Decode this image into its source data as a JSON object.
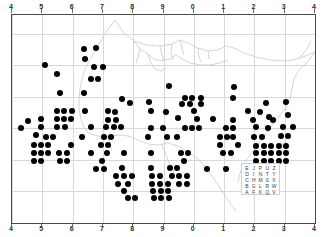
{
  "figure": {
    "kind": "distribution-dot-map",
    "background_color": "#ffffff",
    "frame_color": "#4a4a4a",
    "grid_color": "#d8d8d8",
    "dot_color": "#000000",
    "coastline_color": "#c8c8c8"
  },
  "axes": {
    "top_labels": [
      "4",
      "5",
      "6",
      "7",
      "8",
      "9",
      "0",
      "1",
      "2",
      "3",
      "4"
    ],
    "bottom_labels": [
      "4",
      "5",
      "6",
      "7",
      "8",
      "9",
      "0",
      "1",
      "2",
      "3",
      "4"
    ],
    "left_labels": [
      "8",
      "7",
      "6",
      "5",
      "4",
      "3",
      "2"
    ],
    "right_labels": [
      "8",
      "7",
      "6",
      "5",
      "4",
      "3",
      "2"
    ]
  },
  "legend": {
    "name": "utm-letter-square",
    "rows": [
      [
        "E",
        "J",
        "P",
        "U",
        "Z"
      ],
      [
        "D",
        "I",
        "N",
        "T",
        "Y"
      ],
      [
        "C",
        "H",
        "M",
        "S",
        "X"
      ],
      [
        "B",
        "G",
        "L",
        "R",
        "W"
      ],
      [
        "A",
        "F",
        "K",
        "Q",
        "V"
      ]
    ]
  },
  "chart_data": {
    "type": "scatter",
    "title": "",
    "xlabel": "",
    "ylabel": "",
    "xlim": [
      4,
      14
    ],
    "ylim": [
      2,
      8.6
    ],
    "grid": true,
    "legend_position": "bottom-right",
    "points": [
      {
        "x": 6.38,
        "y": 7.52
      },
      {
        "x": 6.78,
        "y": 7.55
      },
      {
        "x": 6.4,
        "y": 7.22
      },
      {
        "x": 5.1,
        "y": 7.02
      },
      {
        "x": 6.72,
        "y": 6.95
      },
      {
        "x": 7.0,
        "y": 6.95
      },
      {
        "x": 5.5,
        "y": 6.72
      },
      {
        "x": 6.62,
        "y": 6.58
      },
      {
        "x": 6.85,
        "y": 6.58
      },
      {
        "x": 5.58,
        "y": 6.12
      },
      {
        "x": 6.38,
        "y": 6.12
      },
      {
        "x": 9.18,
        "y": 6.35
      },
      {
        "x": 11.32,
        "y": 6.32
      },
      {
        "x": 7.62,
        "y": 5.95
      },
      {
        "x": 9.72,
        "y": 5.98
      },
      {
        "x": 9.95,
        "y": 5.98
      },
      {
        "x": 11.3,
        "y": 5.98
      },
      {
        "x": 10.22,
        "y": 5.98
      },
      {
        "x": 7.88,
        "y": 5.82
      },
      {
        "x": 8.52,
        "y": 5.85
      },
      {
        "x": 9.62,
        "y": 5.78
      },
      {
        "x": 9.88,
        "y": 5.78
      },
      {
        "x": 10.22,
        "y": 5.78
      },
      {
        "x": 13.05,
        "y": 5.85
      },
      {
        "x": 12.38,
        "y": 5.8
      },
      {
        "x": 5.48,
        "y": 5.55
      },
      {
        "x": 5.72,
        "y": 5.55
      },
      {
        "x": 5.98,
        "y": 5.55
      },
      {
        "x": 6.42,
        "y": 5.55
      },
      {
        "x": 7.18,
        "y": 5.55
      },
      {
        "x": 7.4,
        "y": 5.52
      },
      {
        "x": 8.6,
        "y": 5.55
      },
      {
        "x": 9.08,
        "y": 5.52
      },
      {
        "x": 9.48,
        "y": 5.32
      },
      {
        "x": 10.02,
        "y": 5.55
      },
      {
        "x": 11.78,
        "y": 5.55
      },
      {
        "x": 12.18,
        "y": 5.52
      },
      {
        "x": 12.48,
        "y": 5.35
      },
      {
        "x": 13.12,
        "y": 5.42
      },
      {
        "x": 4.52,
        "y": 5.25
      },
      {
        "x": 4.95,
        "y": 5.3
      },
      {
        "x": 5.48,
        "y": 5.3
      },
      {
        "x": 5.72,
        "y": 5.3
      },
      {
        "x": 5.95,
        "y": 5.3
      },
      {
        "x": 7.18,
        "y": 5.28
      },
      {
        "x": 7.42,
        "y": 5.28
      },
      {
        "x": 10.12,
        "y": 5.3
      },
      {
        "x": 10.62,
        "y": 5.3
      },
      {
        "x": 11.3,
        "y": 5.28
      },
      {
        "x": 11.95,
        "y": 5.28
      },
      {
        "x": 12.62,
        "y": 5.28
      },
      {
        "x": 4.28,
        "y": 5.02
      },
      {
        "x": 4.95,
        "y": 5.05
      },
      {
        "x": 5.5,
        "y": 5.05
      },
      {
        "x": 5.75,
        "y": 5.05
      },
      {
        "x": 6.62,
        "y": 5.05
      },
      {
        "x": 7.1,
        "y": 5.05
      },
      {
        "x": 7.35,
        "y": 5.05
      },
      {
        "x": 7.6,
        "y": 5.05
      },
      {
        "x": 8.6,
        "y": 5.02
      },
      {
        "x": 8.98,
        "y": 5.02
      },
      {
        "x": 9.72,
        "y": 5.02
      },
      {
        "x": 9.95,
        "y": 5.02
      },
      {
        "x": 10.18,
        "y": 5.02
      },
      {
        "x": 11.05,
        "y": 5.02
      },
      {
        "x": 11.3,
        "y": 5.02
      },
      {
        "x": 12.05,
        "y": 5.05
      },
      {
        "x": 12.45,
        "y": 5.02
      },
      {
        "x": 12.95,
        "y": 5.05
      },
      {
        "x": 13.28,
        "y": 5.05
      },
      {
        "x": 4.8,
        "y": 4.78
      },
      {
        "x": 5.12,
        "y": 4.72
      },
      {
        "x": 5.35,
        "y": 4.72
      },
      {
        "x": 6.3,
        "y": 4.72
      },
      {
        "x": 7.02,
        "y": 4.72
      },
      {
        "x": 7.28,
        "y": 4.72
      },
      {
        "x": 8.48,
        "y": 4.72
      },
      {
        "x": 9.12,
        "y": 4.72
      },
      {
        "x": 9.45,
        "y": 4.72
      },
      {
        "x": 10.85,
        "y": 4.72
      },
      {
        "x": 11.08,
        "y": 4.72
      },
      {
        "x": 11.3,
        "y": 4.72
      },
      {
        "x": 11.98,
        "y": 4.72
      },
      {
        "x": 12.25,
        "y": 4.72
      },
      {
        "x": 12.88,
        "y": 4.75
      },
      {
        "x": 13.12,
        "y": 4.75
      },
      {
        "x": 4.72,
        "y": 4.48
      },
      {
        "x": 4.95,
        "y": 4.48
      },
      {
        "x": 5.18,
        "y": 4.48
      },
      {
        "x": 5.95,
        "y": 4.48
      },
      {
        "x": 6.95,
        "y": 4.48
      },
      {
        "x": 7.18,
        "y": 4.48
      },
      {
        "x": 10.85,
        "y": 4.48
      },
      {
        "x": 11.45,
        "y": 4.48
      },
      {
        "x": 12.05,
        "y": 4.45
      },
      {
        "x": 12.3,
        "y": 4.45
      },
      {
        "x": 12.55,
        "y": 4.45
      },
      {
        "x": 12.8,
        "y": 4.45
      },
      {
        "x": 13.05,
        "y": 4.45
      },
      {
        "x": 4.72,
        "y": 4.22
      },
      {
        "x": 4.95,
        "y": 4.22
      },
      {
        "x": 5.18,
        "y": 4.22
      },
      {
        "x": 5.55,
        "y": 4.22
      },
      {
        "x": 5.8,
        "y": 4.22
      },
      {
        "x": 6.62,
        "y": 4.22
      },
      {
        "x": 7.12,
        "y": 4.22
      },
      {
        "x": 7.7,
        "y": 4.22
      },
      {
        "x": 8.58,
        "y": 4.22
      },
      {
        "x": 9.58,
        "y": 4.22
      },
      {
        "x": 9.82,
        "y": 4.22
      },
      {
        "x": 10.95,
        "y": 4.22
      },
      {
        "x": 11.22,
        "y": 4.22
      },
      {
        "x": 12.05,
        "y": 4.22
      },
      {
        "x": 12.3,
        "y": 4.22
      },
      {
        "x": 12.55,
        "y": 4.22
      },
      {
        "x": 12.8,
        "y": 4.22
      },
      {
        "x": 13.05,
        "y": 4.22
      },
      {
        "x": 4.72,
        "y": 3.98
      },
      {
        "x": 4.95,
        "y": 3.98
      },
      {
        "x": 5.58,
        "y": 3.98
      },
      {
        "x": 5.82,
        "y": 3.98
      },
      {
        "x": 6.98,
        "y": 3.98
      },
      {
        "x": 9.68,
        "y": 3.98
      },
      {
        "x": 12.05,
        "y": 3.98
      },
      {
        "x": 12.3,
        "y": 3.98
      },
      {
        "x": 12.55,
        "y": 3.98
      },
      {
        "x": 12.8,
        "y": 3.98
      },
      {
        "x": 13.05,
        "y": 3.98
      },
      {
        "x": 6.78,
        "y": 3.72
      },
      {
        "x": 7.02,
        "y": 3.72
      },
      {
        "x": 7.62,
        "y": 3.75
      },
      {
        "x": 8.58,
        "y": 3.75
      },
      {
        "x": 9.22,
        "y": 3.75
      },
      {
        "x": 9.45,
        "y": 3.75
      },
      {
        "x": 10.42,
        "y": 3.72
      },
      {
        "x": 11.05,
        "y": 3.72
      },
      {
        "x": 11.72,
        "y": 3.72
      },
      {
        "x": 11.95,
        "y": 3.72
      },
      {
        "x": 12.18,
        "y": 3.72
      },
      {
        "x": 12.72,
        "y": 3.72
      },
      {
        "x": 7.42,
        "y": 3.48
      },
      {
        "x": 7.68,
        "y": 3.48
      },
      {
        "x": 7.95,
        "y": 3.48
      },
      {
        "x": 8.62,
        "y": 3.48
      },
      {
        "x": 8.88,
        "y": 3.48
      },
      {
        "x": 9.28,
        "y": 3.48
      },
      {
        "x": 9.52,
        "y": 3.48
      },
      {
        "x": 9.78,
        "y": 3.48
      },
      {
        "x": 7.5,
        "y": 3.25
      },
      {
        "x": 7.82,
        "y": 3.25
      },
      {
        "x": 8.62,
        "y": 3.25
      },
      {
        "x": 8.88,
        "y": 3.25
      },
      {
        "x": 9.15,
        "y": 3.25
      },
      {
        "x": 9.52,
        "y": 3.25
      },
      {
        "x": 9.78,
        "y": 3.25
      },
      {
        "x": 7.68,
        "y": 3.02
      },
      {
        "x": 8.65,
        "y": 3.02
      },
      {
        "x": 8.9,
        "y": 3.02
      },
      {
        "x": 9.15,
        "y": 3.02
      },
      {
        "x": 7.82,
        "y": 2.78
      },
      {
        "x": 8.05,
        "y": 2.78
      },
      {
        "x": 8.68,
        "y": 2.78
      },
      {
        "x": 8.92,
        "y": 2.78
      },
      {
        "x": 9.18,
        "y": 2.78
      }
    ]
  }
}
